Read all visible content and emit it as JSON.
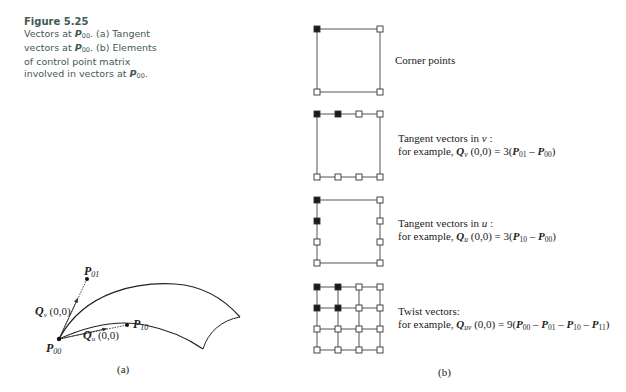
{
  "figure": {
    "title": "Figure 5.25",
    "caption_parts": {
      "l1a": "Vectors at ",
      "p": "P",
      "sub00": "00",
      "l1b": ". (a) Tangent",
      "l2a": "vectors at ",
      "l2b": ". (b) Elements",
      "l3": "of control point matrix",
      "l4a": "involved in vectors at ",
      "l4b": "."
    }
  },
  "panel_a": {
    "label": "(a)",
    "points": {
      "p00": {
        "name": "P",
        "sub": "00"
      },
      "p01": {
        "name": "P",
        "sub": "01"
      },
      "p10": {
        "name": "P",
        "sub": "10"
      }
    },
    "vectors": {
      "qv": {
        "name": "Q",
        "sub": "v",
        "args": " (0,0)"
      },
      "qu": {
        "name": "Q",
        "sub": "u",
        "args": " (0,0)"
      }
    }
  },
  "panel_b": {
    "label": "(b)",
    "grids": [
      {
        "id": "corner",
        "highlighted": [
          [
            0,
            0
          ]
        ],
        "points": [
          [
            0,
            0
          ],
          [
            3,
            0
          ],
          [
            0,
            3
          ],
          [
            3,
            3
          ]
        ]
      },
      {
        "id": "tangent-v",
        "highlighted": [
          [
            0,
            0
          ],
          [
            1,
            0
          ]
        ],
        "points": [
          [
            0,
            0
          ],
          [
            1,
            0
          ],
          [
            2,
            0
          ],
          [
            3,
            0
          ],
          [
            0,
            3
          ],
          [
            1,
            3
          ],
          [
            2,
            3
          ],
          [
            3,
            3
          ]
        ]
      },
      {
        "id": "tangent-u",
        "highlighted": [
          [
            0,
            0
          ],
          [
            0,
            1
          ]
        ],
        "points": [
          [
            0,
            0
          ],
          [
            0,
            1
          ],
          [
            0,
            2
          ],
          [
            0,
            3
          ],
          [
            3,
            0
          ],
          [
            3,
            1
          ],
          [
            3,
            2
          ],
          [
            3,
            3
          ]
        ]
      },
      {
        "id": "twist",
        "highlighted": [
          [
            0,
            0
          ],
          [
            1,
            0
          ],
          [
            0,
            1
          ],
          [
            1,
            1
          ]
        ],
        "full": true
      }
    ],
    "descriptions": {
      "corner": "Corner points",
      "tv_line1": "Tangent vectors in ",
      "tv_var": "v",
      "tv_colon": " :",
      "tv_line2a": "for example, ",
      "Q": "Q",
      "v": "v",
      "tv_args": " (0,0) = 3(",
      "P": "P",
      "s01": "01",
      "s00": "00",
      "s10": "10",
      "s11": "11",
      "minus": " – ",
      "close": ")",
      "tu_line1": "Tangent vectors in ",
      "tu_var": "u",
      "tu_colon": " :",
      "u": "u",
      "tu_args": " (0,0) = 3(",
      "tw_line1": "Twist vectors:",
      "uv": "uv",
      "tw_args": " (0,0) = 9("
    }
  }
}
